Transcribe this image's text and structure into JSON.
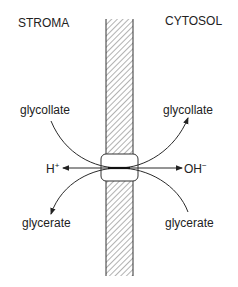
{
  "diagram": {
    "regions": {
      "left": "STROMA",
      "right": "CYTOSOL"
    },
    "membrane": {
      "pattern": "hatched",
      "label": ""
    },
    "transporter": {
      "label": ""
    },
    "flows": [
      {
        "from": "STROMA",
        "to": "CYTOSOL",
        "left_label": "glycollate",
        "right_label": "glycollate",
        "direction": "stroma-to-cytosol"
      },
      {
        "from": "CYTOSOL",
        "to": "STROMA",
        "left_label": "glycerate",
        "right_label": "glycerate",
        "direction": "cytosol-to-stroma"
      },
      {
        "species_left": "H",
        "species_left_charge": "+",
        "species_right": "OH",
        "species_right_charge": "−",
        "direction": "bidirectional"
      }
    ],
    "labels": {
      "glycollate_left": "glycollate",
      "glycollate_right": "glycollate",
      "glycerate_left": "glycerate",
      "glycerate_right": "glycerate",
      "h": "H",
      "h_charge": "+",
      "oh": "OH",
      "oh_charge": "−"
    },
    "colors": {
      "line": "#2a2a2a",
      "hatch": "#555555",
      "background": "#ffffff"
    }
  }
}
